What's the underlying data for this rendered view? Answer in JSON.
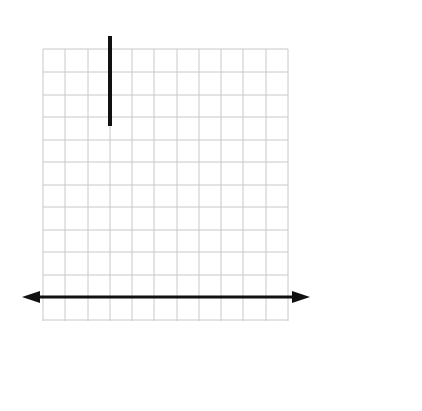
{
  "diagram": {
    "type": "exponential-growth-graph",
    "axes": {
      "x_label": "x",
      "y_label": "y"
    },
    "grid": {
      "columns": 11,
      "rows": 12
    },
    "curve": {
      "description": "exponential curve rising from left to right",
      "color": "#888888"
    },
    "annotations": [
      {
        "id": "top",
        "line1_pre": "The bigger ",
        "line1_bold": "x",
        "line1_post": " gets,",
        "line2": "the faster it climbs"
      },
      {
        "id": "middle",
        "line1_bold": "y = 0",
        "line1_post": " is a",
        "line2": "horizontal",
        "line3": "asymptote"
      },
      {
        "id": "bottom",
        "line1": "Graphs hug asymptotes",
        "line2": "(they get closer and closer and never touch)"
      }
    ]
  },
  "colors": {
    "grid": "#c8c8c8",
    "axis": "#111111",
    "curve": "#8a8a8a",
    "text": "#222222"
  }
}
